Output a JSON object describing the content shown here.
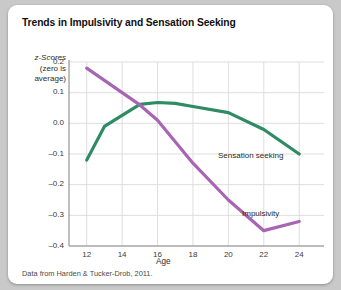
{
  "chart_data": {
    "type": "line",
    "title": "Trends in Impulsivity and Sensation Seeking",
    "xlabel": "Age",
    "ylabel": "z-Scores (zero is average)",
    "ylabel_line1": "z-Scores",
    "ylabel_line2": "(zero is",
    "ylabel_line3": "average)",
    "source": "Data from Harden & Tucker-Drob, 2011.",
    "x": [
      12,
      14,
      16,
      18,
      20,
      22,
      24
    ],
    "xlim": [
      11,
      25.4
    ],
    "ylim": [
      -0.4,
      0.2
    ],
    "xticks": [
      "12",
      "14",
      "16",
      "18",
      "20",
      "22",
      "24"
    ],
    "yticks": [
      "0.2",
      "0.1",
      "0.0",
      "–0.1",
      "–0.2",
      "–0.3",
      "–0.4"
    ],
    "grid": true,
    "legend_position": "inline-right",
    "series": [
      {
        "name": "Sensation seeking",
        "color": "#2e8b63",
        "x": [
          12,
          13,
          15,
          16,
          17,
          18,
          20,
          22,
          24
        ],
        "values": [
          -0.12,
          -0.01,
          0.062,
          0.068,
          0.065,
          0.055,
          0.035,
          -0.02,
          -0.1
        ]
      },
      {
        "name": "Impulsivity",
        "color": "#a865b4",
        "x": [
          12,
          14,
          15,
          16,
          18,
          20,
          22,
          24
        ],
        "values": [
          0.18,
          0.1,
          0.06,
          0.01,
          -0.13,
          -0.25,
          -0.35,
          -0.32
        ]
      }
    ]
  },
  "colors": {
    "sensation_seeking": "#2e8b63",
    "impulsivity": "#a865b4",
    "grid": "#dedede",
    "axis": "#8a8a8a",
    "card": "#ffffff",
    "page": "#c9c9c9"
  }
}
